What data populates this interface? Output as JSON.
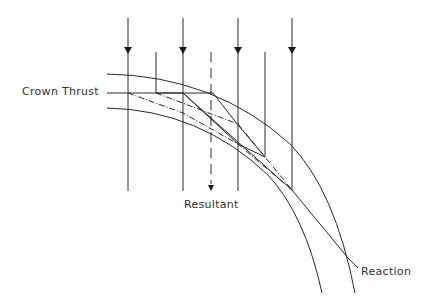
{
  "diagram": {
    "labels": {
      "crown_thrust": "Crown Thrust",
      "resultant": "Resultant",
      "reaction": "Reaction"
    },
    "colors": {
      "line": "#2a2a2a",
      "text": "#333333",
      "background": "#ffffff"
    },
    "load_arrows_x": [
      128,
      183,
      238,
      292
    ],
    "intermediate_lines_x": [
      156,
      265
    ],
    "resultant_x": 211
  }
}
